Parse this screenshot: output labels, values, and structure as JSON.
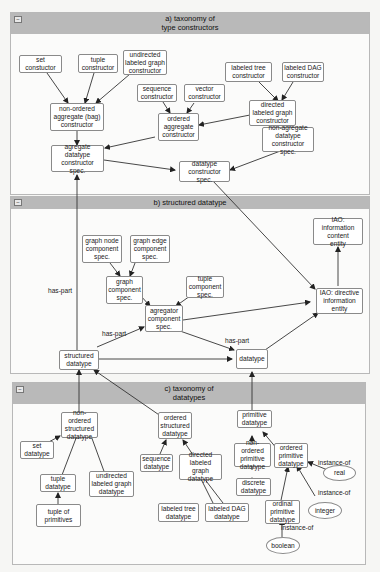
{
  "panels": {
    "a": {
      "title": "a) taxonomy of\ntype constructors"
    },
    "b": {
      "title": "b) structured datatype"
    },
    "c": {
      "title": "c) taxonomy of\ndatatypes"
    }
  },
  "nodes": {
    "set_constructor": "set\nconstuctor",
    "tuple_constructor": "tuple\nconstructor",
    "undirected_labeled_graph_constructor": "undirected\nlabeled graph\nconstructor",
    "labeled_tree_constructor": "labeled tree\nconstructor",
    "labeled_dag_constructor": "labeled DAG\nconstructor",
    "sequence_constructor": "sequence\nconstructor",
    "vector_constructor": "vector\nconstructor",
    "non_ordered_aggregate_constructor": "non-ordered\naggregate (bag)\nconstructor",
    "ordered_aggregate_constructor": "ordered\naggregate\nconstructor",
    "directed_labeled_graph_constructor": "directed\nlabeled graph\nconstructor",
    "non_agregate_datatype_constructor_spec": "non-agregate\ndatatype\nconstructor spec.",
    "agregate_datatype_constructor_spec": "agregate\ndatatype\nconstructor spec.",
    "datatype_constructor_spec": "datatype\nconstructor spec.",
    "iao_information_content_entity": "IAO: information\ncontent\nentity",
    "graph_node_component_spec": "graph node\ncomponent\nspec.",
    "graph_edge_component_spec": "graph edge\ncomponent\nspec.",
    "graph_component_spec": "graph\ncomponent\nspec.",
    "tuple_component_spec": "tuple\ncomponent\nspec.",
    "iao_directive_information_entity": "IAO: directive\ninformation\nentity",
    "agregator_component_spec": "agregator\ncomponent\nspec.",
    "structured_datatype": "structured\ndatatype",
    "datatype": "datatype",
    "non_ordered_structured_datatype": "non-ordered\nstructured\ndatatype",
    "ordered_structured_datatype": "ordered\nstructured\ndatatype",
    "primitive_datatype": "primitive\ndatatype",
    "set_datatype": "set\ndatatype",
    "sequence_datatype": "sequence\ndatatype",
    "directed_labeled_graph_datatype": "directed\nlabeled graph\ndatatype",
    "non_ordered_primitive_datatype": "non-ordered\nprimitive\ndatatype",
    "ordered_primitive_datatype": "ordered\nprimitive\ndatatype",
    "tuple_datatype": "tuple\ndatatype",
    "undirected_labeled_graph_datatype": "undirected\nlabeled graph\ndatatype",
    "tuple_of_primitives": "tuple of\nprimitives",
    "labeled_tree_datatype": "labeled tree\ndatatype",
    "labeled_dag_datatype": "labeled DAG\ndatatype",
    "discrete_datatype": "discrete\ndatatype",
    "ordinal_primitive_datatype": "ordinal\nprimitive\ndatatype",
    "real": "real",
    "integer": "integer",
    "boolean": "boolean"
  },
  "edge_labels": {
    "has_part_1": "has-part",
    "has_part_2": "has-part",
    "has_part_3": "has-part",
    "instance_of_real": "instance-of",
    "instance_of_integer": "instance-of",
    "instance_of_boolean": "instance-of"
  },
  "icons": {
    "collapse": "−"
  }
}
